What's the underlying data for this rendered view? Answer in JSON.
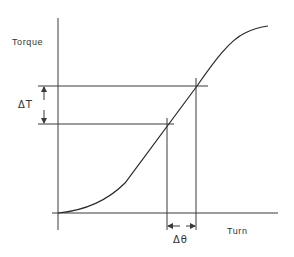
{
  "diagram": {
    "y_axis_label": "Torque",
    "x_axis_label": "Turn",
    "delta_torque_label": "ΔT",
    "delta_angle_label": "Δθ",
    "colors": {
      "line": "#3a3a3a",
      "text": "#333333",
      "background": "#ffffff"
    }
  }
}
